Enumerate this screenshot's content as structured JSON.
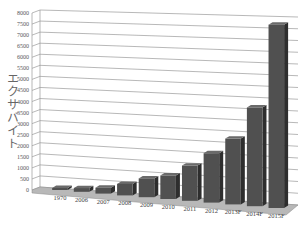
{
  "chart_data": {
    "type": "bar",
    "style": "3d-column",
    "title": "",
    "xlabel": "",
    "ylabel": "エクサバイト",
    "ylim": [
      0,
      8000
    ],
    "yticks": [
      0,
      500,
      1000,
      1500,
      2000,
      2500,
      3000,
      3500,
      4000,
      4500,
      5000,
      5500,
      6000,
      6500,
      7000,
      7500,
      8000
    ],
    "grid": true,
    "legend": null,
    "categories": [
      "1970",
      "2006",
      "2007",
      "2008",
      "2009",
      "2010",
      "2011",
      "2012",
      "2013F",
      "2014F",
      "2015F"
    ],
    "values": [
      50,
      160,
      250,
      490,
      800,
      1000,
      1500,
      2100,
      2800,
      4200,
      7800
    ],
    "bar_color": "#505050"
  }
}
